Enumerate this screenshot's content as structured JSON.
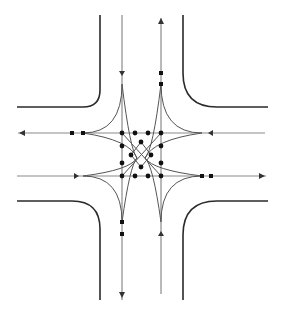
{
  "diagram": {
    "colors": {
      "curb": "#2a2a2a",
      "lane": "#8a8a8a",
      "path": "#555555",
      "node": "#111111",
      "background": "#ffffff"
    },
    "center": {
      "x": 141,
      "y": 158
    },
    "lanes": {
      "vertical_left_x": 122,
      "vertical_right_x": 161,
      "horizontal_top_y": 133,
      "horizontal_bottom_y": 176
    },
    "curbs": [
      {
        "name": "top-left-curb"
      },
      {
        "name": "top-right-curb"
      },
      {
        "name": "bottom-left-curb"
      },
      {
        "name": "bottom-right-curb"
      }
    ],
    "node_count": 24
  }
}
